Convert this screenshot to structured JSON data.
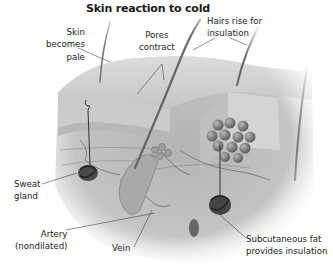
{
  "diagram": {
    "title": "Skin reaction to cold",
    "palette": {
      "background": "#ffffff",
      "text": "#222222",
      "skin_surface": "#d2d2d2",
      "dermis": "#bdbdbd",
      "deep": "#a8a8a8",
      "fat_globule": "#8c8c8c",
      "gland": "#3a3a3a",
      "hair": "#6e6e6e",
      "leader_line": "#444444"
    },
    "labels": {
      "skin_pale": {
        "line1": "Skin",
        "line2": "becomes",
        "line3": "pale"
      },
      "pores": {
        "line1": "Pores",
        "line2": "contract"
      },
      "hairs": {
        "line1": "Hairs rise for",
        "line2": "insulation"
      },
      "sweat": {
        "line1": "Sweat",
        "line2": "gland"
      },
      "artery": {
        "line1": "Artery",
        "line2": "(nondilated)"
      },
      "vein": {
        "line1": "Vein"
      },
      "fat": {
        "line1": "Subcutaneous fat",
        "line2": "provides insulation"
      }
    }
  }
}
